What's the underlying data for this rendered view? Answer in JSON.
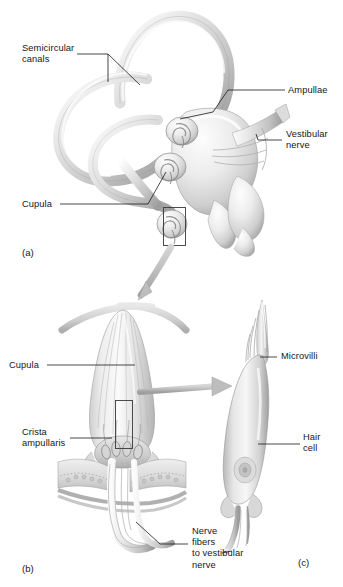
{
  "figure": {
    "background_color": "#ffffff",
    "line_color": "#1a1a1a",
    "arrow_color": "#b9b9b9",
    "structure_fill_light": "#f2f2f2",
    "structure_fill_mid": "#d8d8d8",
    "structure_fill_dark": "#a8a8a8"
  },
  "panels": [
    {
      "id": "panel-a",
      "caption": "(a)",
      "subject": "semicircular-canals-and-vestibule"
    },
    {
      "id": "panel-b",
      "caption": "(b)",
      "subject": "crista-ampullaris-and-cupula"
    },
    {
      "id": "panel-c",
      "caption": "(c)",
      "subject": "hair-cell"
    }
  ],
  "labels": {
    "semicircular_canals": "Semicircular\ncanals",
    "ampullae": "Ampullae",
    "vestibular_nerve": "Vestibular\nnerve",
    "cupula_a": "Cupula",
    "cupula_b": "Cupula",
    "crista_ampullaris": "Crista\nampullaris",
    "nerve_fibers": "Nerve\nfibers\nto vestibular\nnerve",
    "microvilli": "Microvilli",
    "hair_cell": "Hair\ncell"
  },
  "icons": {
    "inset_box_a": "inset-rectangle-icon",
    "inset_box_b": "inset-rectangle-icon",
    "arrow_a_to_b": "curved-arrow-icon",
    "arrow_b_to_c": "right-arrow-icon"
  }
}
